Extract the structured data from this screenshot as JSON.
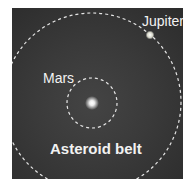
{
  "diagram": {
    "labels": {
      "jupiter": "Jupiter",
      "mars": "Mars",
      "asteroid_belt": "Asteroid belt"
    },
    "colors": {
      "background": "#383838",
      "orbit": "#e6e6e6",
      "text": "#f2f2f2",
      "sun": "#ffffff",
      "jupiter": "#f0f0e0"
    }
  }
}
